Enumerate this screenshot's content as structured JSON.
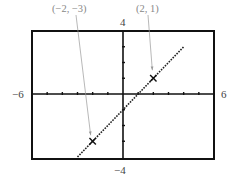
{
  "chart_data": {
    "type": "line",
    "title": "",
    "xlabel": "",
    "ylabel": "",
    "xlim": [
      -6,
      6
    ],
    "ylim": [
      -4,
      4
    ],
    "xscale": 1,
    "yscale": 1,
    "grid": false,
    "x_tick_labels": {
      "min": "−6",
      "max": "6"
    },
    "y_tick_labels": {
      "min": "−4",
      "max": "4"
    },
    "series": [
      {
        "name": "y = x − 1",
        "style": "dotted",
        "x": [
          -3,
          4
        ],
        "y": [
          -4,
          3
        ]
      }
    ],
    "marked_points": [
      {
        "x": -2,
        "y": -3,
        "label": "(−2, −3)",
        "marker": "x"
      },
      {
        "x": 2,
        "y": 1,
        "label": "(2, 1)",
        "marker": "x"
      }
    ]
  },
  "labels": {
    "xmin": "−6",
    "xmax": "6",
    "ymin": "−4",
    "ymax": "4",
    "point_a": "(−2, −3)",
    "point_b": "(2, 1)"
  },
  "colors": {
    "frame": "#111111",
    "axis": "#111111",
    "line": "#222222",
    "leader": "#999999",
    "label": "#444444"
  }
}
